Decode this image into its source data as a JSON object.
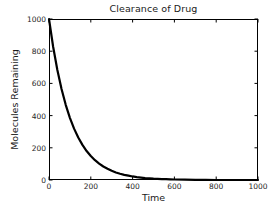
{
  "chart_data": {
    "type": "line",
    "title": "Clearance of Drug",
    "xlabel": "Time",
    "ylabel": "Molecules Remaining",
    "xlim": [
      0,
      1000
    ],
    "ylim": [
      0,
      1000
    ],
    "xticks": [
      0,
      200,
      400,
      600,
      800,
      1000
    ],
    "yticks": [
      0,
      200,
      400,
      600,
      800,
      1000
    ],
    "xtick_labels": [
      "0",
      "200",
      "400",
      "600",
      "800",
      "1000"
    ],
    "ytick_labels": [
      "0",
      "200",
      "400",
      "600",
      "800",
      "1000"
    ],
    "grid": false,
    "legend": false,
    "line_color": "#000000",
    "line_width": 2.2,
    "background_color": "#ffffff",
    "axis_color": "#000000",
    "model": "exponential decay: y = 1000 * exp(-t / 105)",
    "series": [
      {
        "name": "Molecules Remaining",
        "x": [
          0,
          20,
          40,
          60,
          80,
          100,
          120,
          140,
          160,
          180,
          200,
          220,
          240,
          260,
          280,
          300,
          320,
          340,
          360,
          380,
          400,
          420,
          440,
          460,
          480,
          500,
          520,
          540,
          560,
          580,
          600,
          650,
          700,
          750,
          800,
          850,
          900,
          950,
          1000
        ],
        "y": [
          1000,
          826,
          683,
          565,
          467,
          386,
          319,
          264,
          218,
          180,
          149,
          123,
          102,
          84,
          70,
          57,
          47,
          39,
          32,
          27,
          22,
          18,
          15,
          12,
          10,
          8,
          7,
          6,
          5,
          4,
          3,
          2,
          1,
          1,
          0,
          0,
          0,
          0,
          0
        ]
      }
    ]
  }
}
